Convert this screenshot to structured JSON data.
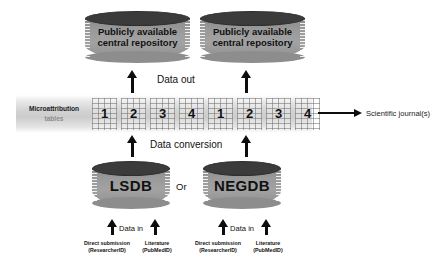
{
  "diagram": {
    "colors": {
      "cylinder_top": "#3b3b3b",
      "cylinder_body": "#9a9a9a",
      "strip_background": "#cccccc",
      "arrow": "#0d0d0d",
      "text": "#111111"
    },
    "repositories": [
      {
        "id": "repo-left",
        "line1": "Publicly available",
        "line2": "central repository"
      },
      {
        "id": "repo-right",
        "line1": "Publicly available",
        "line2": "central repository"
      }
    ],
    "strip": {
      "label_line1": "Microattribution",
      "label_line2": "tables",
      "groups": [
        {
          "id": "group-lsdb",
          "cells": [
            "1",
            "2",
            "3",
            "4"
          ]
        },
        {
          "id": "group-negdb",
          "cells": [
            "1",
            "2",
            "3",
            "4"
          ]
        }
      ]
    },
    "databases": [
      {
        "id": "db-lsdb",
        "name": "LSDB"
      },
      {
        "id": "db-negdb",
        "name": "NEGDB"
      }
    ],
    "or_label": "Or",
    "flow_labels": {
      "data_out": "Data out",
      "data_conversion": "Data conversion",
      "data_in_left": "Data in",
      "data_in_right": "Data in"
    },
    "sources": [
      {
        "id": "source-lsdb-direct",
        "line1": "Direct submission",
        "line2": "(ResearcherID)"
      },
      {
        "id": "source-lsdb-literature",
        "line1": "Literature",
        "line2": "(PubMedID)"
      },
      {
        "id": "source-negdb-direct",
        "line1": "Direct submission",
        "line2": "(ResearcherID)"
      },
      {
        "id": "source-negdb-literature",
        "line1": "Literature",
        "line2": "(PubMedID)"
      }
    ],
    "output": {
      "label": "Scientific journal(s)"
    }
  }
}
